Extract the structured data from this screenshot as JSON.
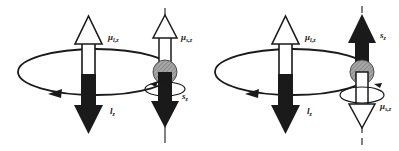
{
  "figure": {
    "background_color": "#ffffff",
    "width": 399,
    "height": 151,
    "stroke_color": "#1a1a1a",
    "fill_black": "#1a1a1a",
    "fill_white": "#ffffff",
    "sphere_color": "#8c8c8c"
  },
  "panels": [
    {
      "id": "left",
      "name": "spin-down-panel",
      "orbital": {
        "name": "orbital-angular-momentum",
        "up_label": "μ",
        "up_label_sub": "l,z",
        "up_arrow_fill": "white",
        "down_label": "l",
        "down_label_sub": "z",
        "down_arrow_fill": "black",
        "orbit_direction": "counterclockwise"
      },
      "spin": {
        "name": "spin-angular-momentum",
        "up_label": "μ",
        "up_label_sub": "s,z",
        "up_arrow_fill": "white",
        "down_label": "s",
        "down_label_sub": "z",
        "down_arrow_fill": "black",
        "axis_style": "solid",
        "precession_direction": "counterclockwise"
      }
    },
    {
      "id": "right",
      "name": "spin-up-panel",
      "orbital": {
        "name": "orbital-angular-momentum",
        "up_label": "μ",
        "up_label_sub": "l,z",
        "up_arrow_fill": "white",
        "down_label": "l",
        "down_label_sub": "z",
        "down_arrow_fill": "black",
        "orbit_direction": "counterclockwise"
      },
      "spin": {
        "name": "spin-angular-momentum",
        "up_label": "s",
        "up_label_sub": "z",
        "up_arrow_fill": "black",
        "down_label": "μ",
        "down_label_sub": "s,z",
        "down_arrow_fill": "white",
        "axis_style": "dashed",
        "precession_direction": "clockwise"
      }
    }
  ]
}
